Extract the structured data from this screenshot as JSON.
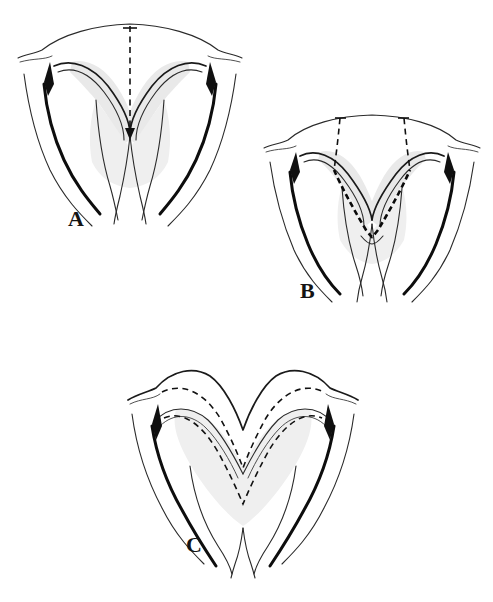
{
  "figure": {
    "background_color": "#ffffff",
    "ink_color": "#111111",
    "shade_color": "#e9e9e9",
    "dashed_marking_color": "#0a0a0a",
    "panel_count": 3
  },
  "panels": [
    {
      "id": "A",
      "label": "A",
      "caption": "",
      "markings": "single vertical dashed midline with cross tick at superior arch, terminating at the apex of the central notch",
      "dashed_line_count": 1
    },
    {
      "id": "B",
      "label": "B",
      "caption": "",
      "markings": "two oblique dashed lines descending from the superior arch converging into a heavy dashed V tracing the inner margin",
      "dashed_line_count": 3
    },
    {
      "id": "C",
      "label": "C",
      "caption": "",
      "markings": "two nested dashed contours forming a broad W outlining the advanced flap borders",
      "dashed_line_count": 2
    }
  ],
  "labels": {
    "a": "A",
    "b": "B",
    "c": "C"
  }
}
